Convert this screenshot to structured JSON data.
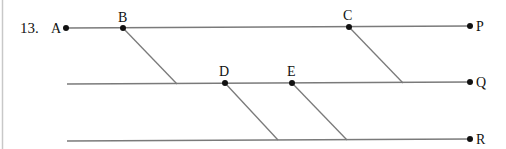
{
  "problem": {
    "number": "13."
  },
  "colors": {
    "line": "#7a7a7a",
    "point": "#111111",
    "border": "#c8c8c8"
  },
  "lines": [
    {
      "name": "AP",
      "y": 27,
      "x1": 66,
      "x2": 470,
      "end_label": "P"
    },
    {
      "name": "Q-line",
      "y": 83,
      "x1": 67,
      "x2": 470,
      "end_label": "Q"
    },
    {
      "name": "R-line",
      "y": 139,
      "x1": 67,
      "x2": 470,
      "end_label": "R"
    }
  ],
  "points": {
    "A": {
      "label": "A"
    },
    "B": {
      "label": "B"
    },
    "C": {
      "label": "C"
    },
    "D": {
      "label": "D"
    },
    "E": {
      "label": "E"
    },
    "P": {
      "label": "P"
    },
    "Q": {
      "label": "Q"
    },
    "R": {
      "label": "R"
    }
  },
  "transversals": [
    {
      "from": "B",
      "to_line": "Q"
    },
    {
      "from": "C",
      "to_line": "Q"
    },
    {
      "from": "D",
      "to_line": "R"
    },
    {
      "from": "E",
      "to_line": "R"
    }
  ]
}
